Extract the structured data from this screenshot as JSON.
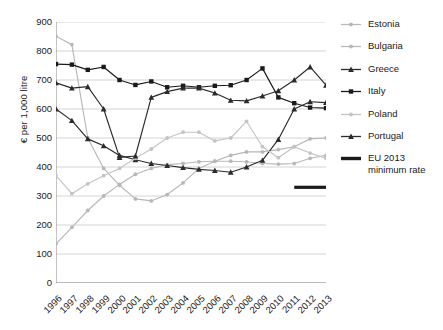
{
  "chart_data": {
    "type": "line",
    "title": "",
    "xlabel": "",
    "ylabel": "€ per 1,000 litre",
    "x": [
      1996,
      1997,
      1998,
      1999,
      2000,
      2001,
      2002,
      2003,
      2004,
      2005,
      2006,
      2007,
      2008,
      2009,
      2010,
      2011,
      2012,
      2013
    ],
    "xlim": [
      1996,
      2013
    ],
    "ylim": [
      0,
      900
    ],
    "yticks": [
      0,
      100,
      200,
      300,
      400,
      500,
      600,
      700,
      800,
      900
    ],
    "xticks": [
      "1996",
      "1997",
      "1998",
      "1999",
      "2000",
      "2001",
      "2002",
      "2003",
      "2004",
      "2005",
      "2006",
      "2007",
      "2008",
      "2009",
      "2010",
      "2011",
      "2012",
      "2013"
    ],
    "grid": "horizontal",
    "legend_position": "right",
    "series": [
      {
        "name": "Estonia",
        "color": "#b8b8b8",
        "marker": "circle",
        "values": [
          851,
          822,
          500,
          395,
          337,
          290,
          283,
          305,
          345,
          395,
          420,
          440,
          452,
          452,
          460,
          470,
          497,
          500
        ]
      },
      {
        "name": "Bulgaria",
        "color": "#b8b8b8",
        "marker": "circle",
        "values": [
          135,
          192,
          250,
          300,
          340,
          375,
          395,
          408,
          412,
          418,
          420,
          420,
          418,
          412,
          410,
          412,
          430,
          440
        ]
      },
      {
        "name": "Greece",
        "color": "#2b2b2b",
        "marker": "triangle",
        "values": [
          600,
          560,
          497,
          473,
          440,
          425,
          412,
          405,
          398,
          392,
          388,
          382,
          400,
          423,
          495,
          600,
          625,
          622
        ]
      },
      {
        "name": "Italy",
        "color": "#1a1a1a",
        "marker": "square",
        "values": [
          755,
          753,
          735,
          745,
          700,
          683,
          695,
          675,
          680,
          675,
          680,
          682,
          700,
          740,
          640,
          620,
          605,
          603
        ]
      },
      {
        "name": "Poland",
        "color": "#c4c4c4",
        "marker": "circle",
        "values": [
          370,
          308,
          342,
          370,
          395,
          430,
          462,
          500,
          520,
          520,
          490,
          500,
          557,
          470,
          432,
          470,
          448,
          430
        ]
      },
      {
        "name": "Portugal",
        "color": "#2b2b2b",
        "marker": "triangle",
        "values": [
          690,
          672,
          677,
          600,
          433,
          438,
          640,
          660,
          672,
          672,
          655,
          630,
          628,
          645,
          663,
          700,
          745,
          682
        ]
      },
      {
        "name": "EU 2013 minimum rate",
        "color": "#1a1a1a",
        "marker": "none",
        "style": "thick-flat",
        "values": [
          null,
          null,
          null,
          null,
          null,
          null,
          null,
          null,
          null,
          null,
          null,
          null,
          null,
          null,
          null,
          330,
          330,
          330
        ]
      }
    ]
  },
  "legend": {
    "items": [
      {
        "label": "Estonia"
      },
      {
        "label": "Bulgaria"
      },
      {
        "label": "Greece"
      },
      {
        "label": "Italy"
      },
      {
        "label": "Poland"
      },
      {
        "label": "Portugal"
      },
      {
        "label": "EU 2013 minimum rate"
      }
    ]
  }
}
